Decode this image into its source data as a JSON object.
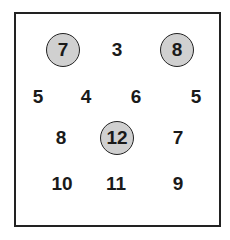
{
  "grid": {
    "cells": [
      {
        "value": "7",
        "circled": true,
        "x": 63,
        "y": 50
      },
      {
        "value": "3",
        "circled": false,
        "x": 117,
        "y": 50
      },
      {
        "value": "8",
        "circled": true,
        "x": 177,
        "y": 50
      },
      {
        "value": "5",
        "circled": false,
        "x": 38,
        "y": 97
      },
      {
        "value": "4",
        "circled": false,
        "x": 86,
        "y": 97
      },
      {
        "value": "6",
        "circled": false,
        "x": 136,
        "y": 97
      },
      {
        "value": "5",
        "circled": false,
        "x": 196,
        "y": 97
      },
      {
        "value": "8",
        "circled": false,
        "x": 61,
        "y": 138
      },
      {
        "value": "12",
        "circled": true,
        "x": 117,
        "y": 138
      },
      {
        "value": "7",
        "circled": false,
        "x": 178,
        "y": 138
      },
      {
        "value": "10",
        "circled": false,
        "x": 62,
        "y": 184
      },
      {
        "value": "11",
        "circled": false,
        "x": 116,
        "y": 184
      },
      {
        "value": "9",
        "circled": false,
        "x": 178,
        "y": 184
      }
    ],
    "circle_fill": "#d0d0d0"
  }
}
